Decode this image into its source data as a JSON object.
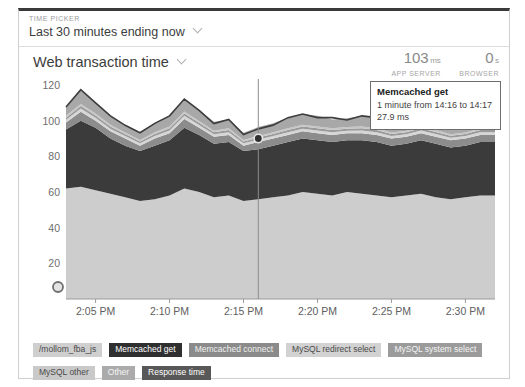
{
  "time_picker": {
    "label": "TIME PICKER",
    "value": "Last 30 minutes ending now",
    "chevron": "chevron-down-icon"
  },
  "chart_header": {
    "title": "Web transaction time",
    "chevron": "chevron-down-icon",
    "metrics": [
      {
        "value": "103",
        "unit": "ms",
        "name": "APP SERVER"
      },
      {
        "value": "0",
        "unit": "s",
        "name": "BROWSER"
      }
    ]
  },
  "tooltip": {
    "title": "Memcached get",
    "range": "1 minute from 14:16 to 14:17",
    "value": "27.9 ms"
  },
  "chart_data": {
    "type": "area",
    "title": "Web transaction time",
    "xlabel": "",
    "ylabel": "",
    "ylim": [
      0,
      120
    ],
    "yticks": [
      20,
      40,
      60,
      80,
      100,
      120
    ],
    "grid": false,
    "legend_position": "bottom",
    "stacked": true,
    "xticks": [
      "2:05 PM",
      "2:10 PM",
      "2:15 PM",
      "2:20 PM",
      "2:25 PM",
      "2:30 PM"
    ],
    "x": [
      "2:03 PM",
      "2:04 PM",
      "2:05 PM",
      "2:06 PM",
      "2:07 PM",
      "2:08 PM",
      "2:09 PM",
      "2:10 PM",
      "2:11 PM",
      "2:12 PM",
      "2:13 PM",
      "2:14 PM",
      "2:15 PM",
      "2:16 PM",
      "2:17 PM",
      "2:18 PM",
      "2:19 PM",
      "2:20 PM",
      "2:21 PM",
      "2:22 PM",
      "2:23 PM",
      "2:24 PM",
      "2:25 PM",
      "2:26 PM",
      "2:27 PM",
      "2:28 PM",
      "2:29 PM",
      "2:30 PM",
      "2:31 PM",
      "2:32 PM"
    ],
    "series": [
      {
        "name": "/mollom_fba_js",
        "color": "#cdcdcd",
        "values": [
          62,
          63,
          61,
          59,
          57,
          55,
          56,
          58,
          62,
          60,
          57,
          58,
          55,
          56,
          57,
          58,
          60,
          59,
          58,
          60,
          59,
          58,
          57,
          58,
          59,
          57,
          56,
          57,
          58,
          58
        ]
      },
      {
        "name": "Memcached get",
        "color": "#3b3b3b",
        "values": [
          33,
          37,
          35,
          31,
          29,
          28,
          30,
          31,
          34,
          32,
          30,
          30,
          28,
          28,
          29,
          30,
          30,
          30,
          30,
          29,
          30,
          30,
          29,
          29,
          30,
          30,
          29,
          29,
          30,
          30
        ]
      },
      {
        "name": "Memcached connect",
        "color": "#8c8c8c",
        "values": [
          4,
          5,
          4,
          4,
          4,
          3,
          4,
          4,
          5,
          4,
          4,
          4,
          3,
          4,
          4,
          4,
          4,
          4,
          4,
          4,
          4,
          4,
          4,
          4,
          4,
          4,
          4,
          4,
          4,
          4
        ]
      },
      {
        "name": "MySQL redirect select",
        "color": "#d6d6d6",
        "values": [
          1.5,
          1.8,
          1.6,
          1.5,
          1.4,
          1.3,
          1.4,
          1.5,
          1.7,
          1.6,
          1.4,
          1.5,
          1.3,
          1.4,
          1.4,
          1.5,
          1.5,
          1.5,
          1.5,
          1.4,
          1.5,
          1.5,
          1.4,
          1.4,
          1.5,
          1.5,
          1.4,
          1.4,
          1.5,
          1.5
        ]
      },
      {
        "name": "MySQL system select",
        "color": "#9a9a9a",
        "values": [
          1.2,
          1.4,
          1.3,
          1.2,
          1.1,
          1.0,
          1.1,
          1.2,
          1.3,
          1.2,
          1.1,
          1.2,
          1.0,
          1.1,
          1.1,
          1.2,
          1.2,
          1.2,
          1.2,
          1.1,
          1.2,
          1.2,
          1.1,
          1.1,
          1.2,
          1.2,
          1.1,
          1.1,
          1.2,
          1.2
        ]
      },
      {
        "name": "MySQL other",
        "color": "#c6c6c6",
        "values": [
          1.0,
          1.2,
          1.1,
          1.0,
          0.9,
          0.9,
          1.0,
          1.0,
          1.1,
          1.0,
          0.9,
          1.0,
          0.9,
          0.9,
          1.0,
          1.0,
          1.0,
          1.0,
          1.0,
          0.9,
          1.0,
          1.0,
          0.9,
          0.9,
          1.0,
          1.0,
          0.9,
          0.9,
          1.0,
          1.0
        ]
      },
      {
        "name": "Other",
        "color": "#a8a8a8",
        "values": [
          5,
          8,
          6,
          5,
          4,
          4,
          5,
          6,
          7,
          6,
          5,
          5,
          4,
          5,
          5,
          6,
          6,
          6,
          5,
          5,
          6,
          6,
          5,
          5,
          6,
          6,
          5,
          5,
          6,
          6
        ]
      }
    ],
    "response_time_line": {
      "name": "Response time",
      "color": "#3d3d3d",
      "values": [
        107.7,
        117.4,
        110,
        102.7,
        97.4,
        93.2,
        98.5,
        102.7,
        112.1,
        105.8,
        98.4,
        100.7,
        92.2,
        95.4,
        97.5,
        101.7,
        103.7,
        101.7,
        101.7,
        100.4,
        102.7,
        101.7,
        97.4,
        98.4,
        102.7,
        100.7,
        97.4,
        98.4,
        101.7,
        101.7
      ]
    },
    "marker": {
      "x": "2:16 PM",
      "y": 90,
      "label": "crosshair-marker"
    }
  },
  "legend": {
    "rows": [
      [
        {
          "label": "/mollom_fba_js",
          "color": "#cfcfcf",
          "text_color": "#4a4a4a"
        },
        {
          "label": "Memcached get",
          "color": "#2f2f2f",
          "text_color": "#ffffff"
        },
        {
          "label": "Memcached connect",
          "color": "#8b8b8b",
          "text_color": "#f0f0f0"
        },
        {
          "label": "MySQL redirect select",
          "color": "#d2d2d2",
          "text_color": "#4a4a4a"
        },
        {
          "label": "MySQL system select",
          "color": "#9b9b9b",
          "text_color": "#f5f5f5"
        }
      ],
      [
        {
          "label": "MySQL other",
          "color": "#c9c9c9",
          "text_color": "#4a4a4a"
        },
        {
          "label": "Other",
          "color": "#ababab",
          "text_color": "#f5f5f5"
        },
        {
          "label": "Response time",
          "color": "#585858",
          "text_color": "#ffffff"
        }
      ]
    ]
  }
}
